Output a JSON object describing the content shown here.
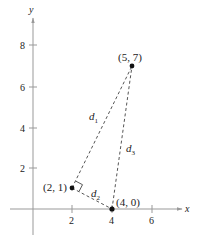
{
  "diagram": {
    "type": "coordinate-plane-triangle",
    "axes": {
      "x_label": "x",
      "y_label": "y",
      "x_ticks": [
        "2",
        "4",
        "6"
      ],
      "y_ticks": [
        "2",
        "4",
        "6",
        "8"
      ]
    },
    "points": [
      {
        "label": "(5, 7)",
        "x": 5,
        "y": 7
      },
      {
        "label": "(2, 1)",
        "x": 2,
        "y": 1
      },
      {
        "label": "(4, 0)",
        "x": 4,
        "y": 0
      }
    ],
    "segments": [
      {
        "name": "d",
        "sub": "1",
        "from": "(2, 1)",
        "to": "(5, 7)"
      },
      {
        "name": "d",
        "sub": "2",
        "from": "(2, 1)",
        "to": "(4, 0)"
      },
      {
        "name": "d",
        "sub": "3",
        "from": "(4, 0)",
        "to": "(5, 7)"
      }
    ],
    "right_angle_at": "(2, 1)",
    "colors": {
      "axis": "#999999",
      "dash": "#555555",
      "point": "#111111",
      "text": "#222222"
    }
  }
}
